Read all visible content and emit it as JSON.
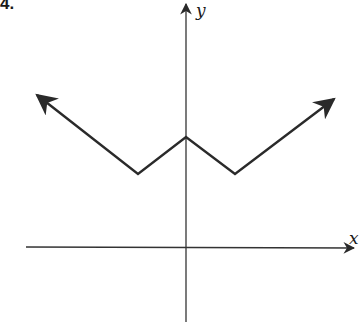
{
  "problem_number": "4.",
  "axes": {
    "x_label": "x",
    "y_label": "y"
  },
  "graph": {
    "description": "V-shaped piecewise linear graph (W shape) with arrows at both ends",
    "points_px": [
      [
        37,
        95
      ],
      [
        138,
        174
      ],
      [
        186,
        137
      ],
      [
        235,
        174
      ],
      [
        334,
        99
      ]
    ],
    "stroke_color": "#2a2a2a"
  },
  "colors": {
    "line": "#2a2a2a",
    "axis": "#333333",
    "background": "#ffffff"
  }
}
